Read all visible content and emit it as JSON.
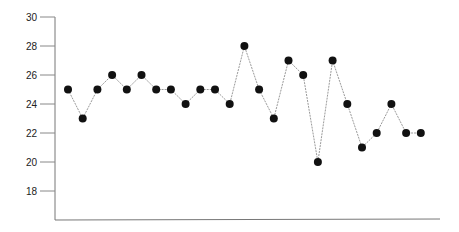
{
  "chart_data": {
    "type": "line",
    "title": "",
    "xlabel": "",
    "ylabel": "",
    "ylim": [
      16,
      30
    ],
    "yticks": [
      30,
      28,
      26,
      24,
      22,
      20,
      18
    ],
    "ytick_labels": [
      "30",
      "28",
      "26",
      "24",
      "22",
      "20",
      "18"
    ],
    "grid": false,
    "legend": null,
    "x": [
      1,
      2,
      3,
      4,
      5,
      6,
      7,
      8,
      9,
      10,
      11,
      12,
      13,
      14,
      15,
      16,
      17,
      18,
      19,
      20,
      21,
      22,
      23,
      24,
      25
    ],
    "series": [
      {
        "name": "series-1",
        "values": [
          25,
          23,
          25,
          26,
          25,
          26,
          25,
          25,
          24,
          25,
          25,
          24,
          28,
          25,
          23,
          27,
          26,
          20,
          27,
          24,
          21,
          22,
          24,
          22,
          22
        ],
        "marker": "filled-circle",
        "marker_color": "#111111",
        "line_color": "#9a9a9a"
      }
    ]
  }
}
